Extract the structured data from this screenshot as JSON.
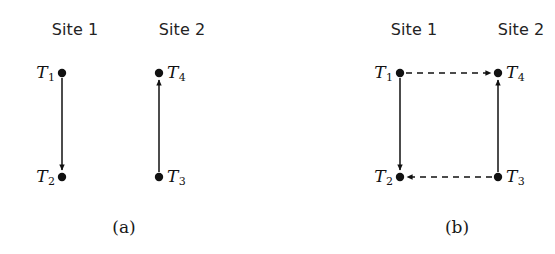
{
  "figure": {
    "background_color": "#ffffff",
    "ink_color": "#111111",
    "panels": [
      {
        "id": "a",
        "caption": "(a)",
        "caption_x": 124,
        "caption_y": 228,
        "sites": [
          {
            "label": "Site 1",
            "x": 75,
            "y": 30
          },
          {
            "label": "Site 2",
            "x": 182,
            "y": 30
          }
        ],
        "nodes": [
          {
            "id": "T1",
            "base": "T",
            "sub": "1",
            "x": 62,
            "y": 73,
            "label_side": "left"
          },
          {
            "id": "T2",
            "base": "T",
            "sub": "2",
            "x": 62,
            "y": 177,
            "label_side": "left"
          },
          {
            "id": "T4",
            "base": "T",
            "sub": "4",
            "x": 159,
            "y": 73,
            "label_side": "right"
          },
          {
            "id": "T3",
            "base": "T",
            "sub": "3",
            "x": 159,
            "y": 177,
            "label_side": "right"
          }
        ],
        "edges": [
          {
            "id": "T1-to-T2",
            "from": "T1",
            "to": "T2",
            "style": "solid",
            "x1": 62,
            "y1": 78,
            "x2": 62,
            "y2": 170
          },
          {
            "id": "T3-to-T4",
            "from": "T3",
            "to": "T4",
            "style": "solid",
            "x1": 159,
            "y1": 172,
            "x2": 159,
            "y2": 80
          }
        ]
      },
      {
        "id": "b",
        "caption": "(b)",
        "caption_x": 179,
        "caption_y": 228,
        "sites": [
          {
            "label": "Site 1",
            "x": 136,
            "y": 30
          },
          {
            "label": "Site 2",
            "x": 243,
            "y": 30
          }
        ],
        "nodes": [
          {
            "id": "T1",
            "base": "T",
            "sub": "1",
            "x": 122,
            "y": 73,
            "label_side": "left"
          },
          {
            "id": "T2",
            "base": "T",
            "sub": "2",
            "x": 122,
            "y": 177,
            "label_side": "left"
          },
          {
            "id": "T4",
            "base": "T",
            "sub": "4",
            "x": 220,
            "y": 73,
            "label_side": "right"
          },
          {
            "id": "T3",
            "base": "T",
            "sub": "3",
            "x": 220,
            "y": 177,
            "label_side": "right"
          }
        ],
        "edges": [
          {
            "id": "T1-to-T2",
            "from": "T1",
            "to": "T2",
            "style": "solid",
            "x1": 122,
            "y1": 78,
            "x2": 122,
            "y2": 170
          },
          {
            "id": "T3-to-T4",
            "from": "T3",
            "to": "T4",
            "style": "solid",
            "x1": 220,
            "y1": 172,
            "x2": 220,
            "y2": 80
          },
          {
            "id": "T1-to-T4",
            "from": "T1",
            "to": "T4",
            "style": "dashed",
            "x1": 128,
            "y1": 73,
            "x2": 213,
            "y2": 73
          },
          {
            "id": "T3-to-T2",
            "from": "T3",
            "to": "T2",
            "style": "dashed",
            "x1": 214,
            "y1": 177,
            "x2": 129,
            "y2": 177
          }
        ]
      }
    ]
  }
}
